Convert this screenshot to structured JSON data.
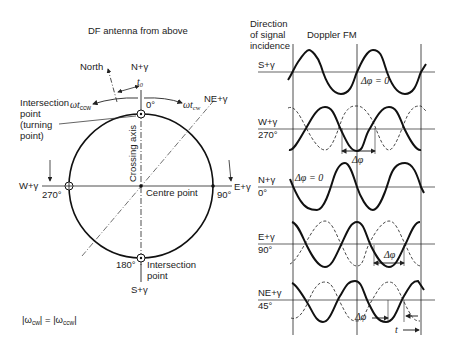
{
  "left": {
    "title": "DF antenna from above",
    "north_label": "North",
    "n_label": "N+γ",
    "t0_label": "t₀",
    "omega_ccw": "ωt",
    "omega_ccw_sub": "ccw",
    "omega_cw": "ωt",
    "omega_cw_sub": "cw",
    "deg0": "0°",
    "ne_label": "NE+γ",
    "intersection_label_1": "Intersection",
    "intersection_label_2": "point",
    "intersection_label_3": "(turning",
    "intersection_label_4": "point)",
    "crossing_axis": "Crossing axis",
    "w_label": "W+γ",
    "deg270": "270°",
    "centre_point": "Centre point",
    "deg90": "90°",
    "e_label": "E+γ",
    "deg180": "180°",
    "bottom_intersection_1": "Intersection",
    "bottom_intersection_2": "point",
    "s_label": "S+γ",
    "formula_left": "|ω",
    "formula_left_sub": "cw",
    "formula_mid": "| = |ω",
    "formula_right_sub": "ccw",
    "formula_end": "|"
  },
  "right": {
    "header_1": "Direction",
    "header_2": "of signal",
    "header_3": "incidence",
    "doppler_title": "Doppler FM",
    "rows": [
      {
        "name": "S+γ",
        "deg": "",
        "annotation": "Δφ = 0"
      },
      {
        "name": "W+γ",
        "deg": "270°",
        "annotation": "Δφ"
      },
      {
        "name": "N+γ",
        "deg": "0°",
        "annotation": "Δφ = 0"
      },
      {
        "name": "E+γ",
        "deg": "90°",
        "annotation": "Δφ"
      },
      {
        "name": "NE+γ",
        "deg": "45°",
        "annotation": "Δφ"
      }
    ],
    "time_label": "t"
  }
}
